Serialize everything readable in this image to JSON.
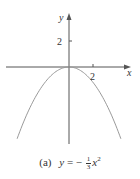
{
  "chart_data": {
    "type": "line",
    "xlabel": "x",
    "ylabel": "y",
    "function": "y = -(1/3) x^2",
    "x_ticks": [
      2
    ],
    "y_ticks": [
      2
    ],
    "xlim": [
      -5,
      5
    ],
    "ylim": [
      -6,
      5
    ],
    "grid": false,
    "series": [
      {
        "name": "y = -1/3 x^2",
        "x": [
          -4,
          -3,
          -2,
          -1,
          0,
          1,
          2,
          3,
          4
        ],
        "y": [
          -5.33,
          -3,
          -1.33,
          -0.33,
          0,
          -0.33,
          -1.33,
          -3,
          -5.33
        ]
      }
    ],
    "colors": {
      "axis": "#555555",
      "curve": "#9a9a9a",
      "text": "#333333"
    }
  },
  "labels": {
    "x_axis": "x",
    "y_axis": "y",
    "x_tick": "2",
    "y_tick": "2",
    "caption_label": "(a)",
    "caption_lhs": "y",
    "caption_eq": "= −",
    "caption_num": "1",
    "caption_den": "3",
    "caption_var": "x",
    "caption_exp": "2"
  }
}
